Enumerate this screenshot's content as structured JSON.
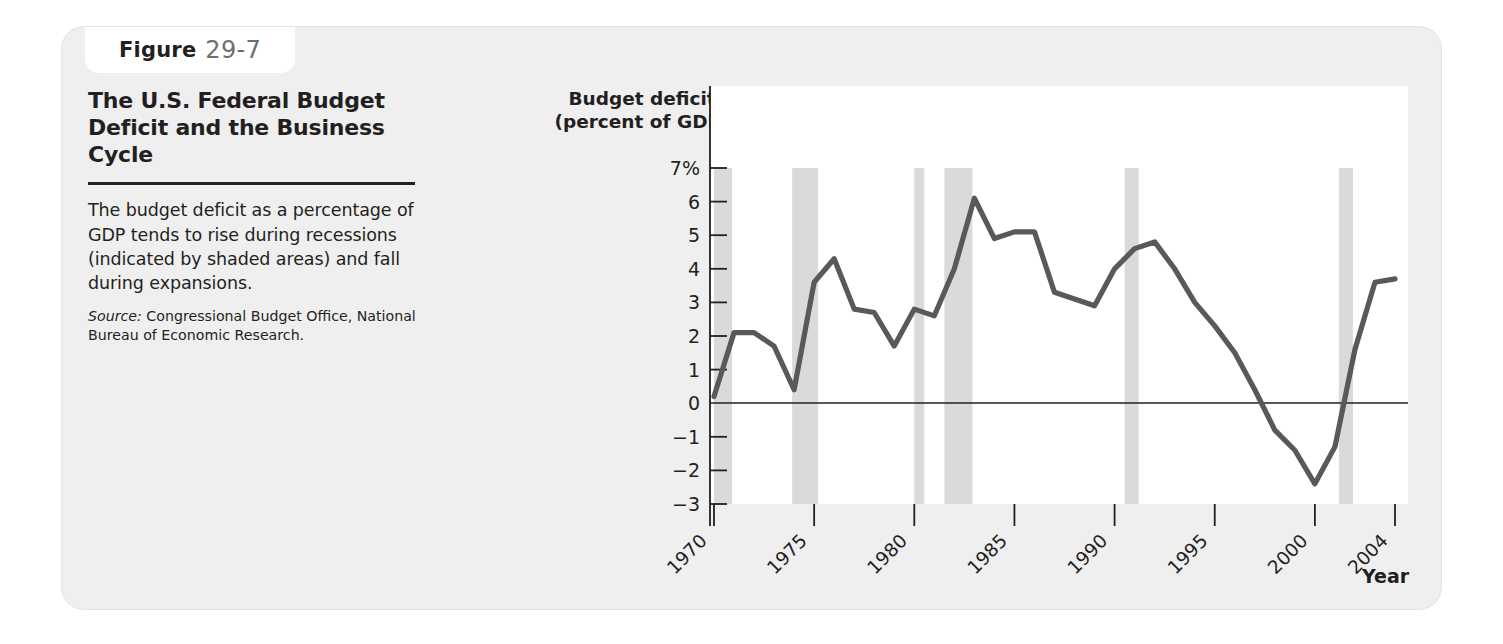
{
  "figure": {
    "label_word": "Figure",
    "number": "29-7",
    "title": "The U.S. Federal Budget Deficit and the Business Cycle",
    "caption": "The budget deficit as a percentage of GDP tends to rise during recessions (indicated by shaded areas) and fall during expansions.",
    "source_label": "Source:",
    "source_text": "Congressional Budget Office, National Bureau of Economic Research."
  },
  "chart_data": {
    "type": "line",
    "title": "The U.S. Federal Budget Deficit and the Business Cycle",
    "ylabel": "Budget deficit\n(percent of GDP)",
    "ylabel_line1": "Budget deficit",
    "ylabel_line2": "(percent of GDP)",
    "xlabel": "Year",
    "ylim": [
      -3,
      7
    ],
    "xlim": [
      1970,
      2004
    ],
    "grid": false,
    "legend": "none",
    "y_ticks": [
      7,
      6,
      5,
      4,
      3,
      2,
      1,
      0,
      -1,
      -2,
      -3
    ],
    "y_tick_labels": [
      "7%",
      "6",
      "5",
      "4",
      "3",
      "2",
      "1",
      "0",
      "−1",
      "−2",
      "−3"
    ],
    "x_ticks": [
      1970,
      1975,
      1980,
      1985,
      1990,
      1995,
      2000,
      2004
    ],
    "x_tick_labels": [
      "1970",
      "1975",
      "1980",
      "1985",
      "1990",
      "1995",
      "2000",
      "2004"
    ],
    "zero_line": 0,
    "series_name": "Federal budget deficit (percent of GDP)",
    "line_color": "#58595b",
    "recession_band_color": "#d9dadb",
    "x": [
      1970,
      1971,
      1972,
      1973,
      1974,
      1975,
      1976,
      1977,
      1978,
      1979,
      1980,
      1981,
      1982,
      1983,
      1984,
      1985,
      1986,
      1987,
      1988,
      1989,
      1990,
      1991,
      1992,
      1993,
      1994,
      1995,
      1996,
      1997,
      1998,
      1999,
      2000,
      2001,
      2002,
      2003,
      2004
    ],
    "values": [
      0.2,
      2.1,
      2.1,
      1.7,
      0.4,
      3.6,
      4.3,
      2.8,
      2.7,
      1.7,
      2.8,
      2.6,
      4.0,
      6.1,
      4.9,
      5.1,
      5.1,
      3.3,
      3.1,
      2.9,
      4.0,
      4.6,
      4.8,
      4.0,
      3.0,
      2.3,
      1.5,
      0.4,
      -0.8,
      -1.4,
      -2.4,
      -1.3,
      1.6,
      3.6,
      3.7
    ],
    "recessions": [
      {
        "start": 1970.0,
        "end": 1970.9
      },
      {
        "start": 1973.9,
        "end": 1975.2
      },
      {
        "start": 1980.0,
        "end": 1980.5
      },
      {
        "start": 1981.5,
        "end": 1982.9
      },
      {
        "start": 1990.5,
        "end": 1991.2
      },
      {
        "start": 2001.2,
        "end": 2001.9
      }
    ],
    "annotations": []
  }
}
